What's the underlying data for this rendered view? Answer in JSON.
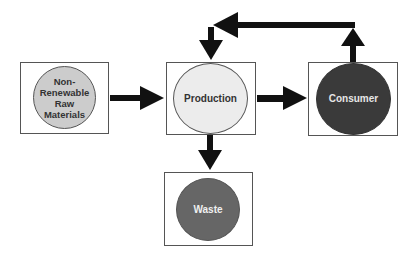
{
  "diagram": {
    "nodes": [
      {
        "id": "raw",
        "label": "Non-\nRenewable\nRaw\nMaterials",
        "fill": "#cccccc",
        "text_color": "#333333"
      },
      {
        "id": "production",
        "label": "Production",
        "fill": "#ececec",
        "text_color": "#333333"
      },
      {
        "id": "consumer",
        "label": "Consumer",
        "fill": "#3a3a3a",
        "text_color": "#e6e6e6"
      },
      {
        "id": "waste",
        "label": "Waste",
        "fill": "#666666",
        "text_color": "#f0f0f0"
      }
    ],
    "edges": [
      {
        "from": "raw",
        "to": "production"
      },
      {
        "from": "production",
        "to": "consumer"
      },
      {
        "from": "production",
        "to": "waste"
      },
      {
        "from": "consumer",
        "to": "production"
      }
    ],
    "arrow_color": "#111111"
  }
}
